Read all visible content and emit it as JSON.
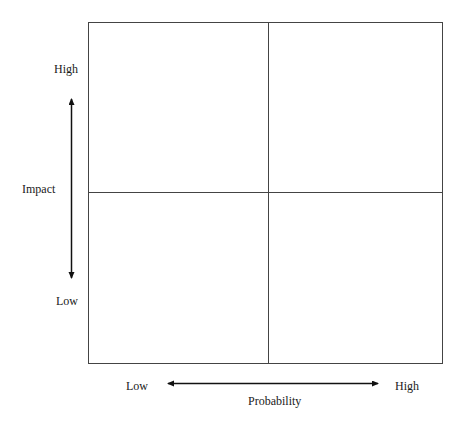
{
  "diagram": {
    "type": "risk-matrix-2x2",
    "y_axis": {
      "label": "Impact",
      "high": "High",
      "low": "Low"
    },
    "x_axis": {
      "label": "Probability",
      "low": "Low",
      "high": "High"
    },
    "quadrants": [
      "",
      "",
      "",
      ""
    ],
    "colors": {
      "line": "#333333",
      "background": "#ffffff"
    }
  }
}
